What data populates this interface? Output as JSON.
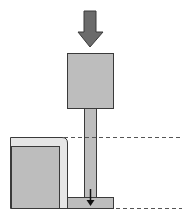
{
  "diagram": {
    "title": "",
    "colors": {
      "background": "#ffffff",
      "force_arrow": "#6b6b6b",
      "block_fill": "#bdbdbd",
      "frame_fill": "#e6e6e6",
      "outline": "#3a3a3a",
      "dash": "#555555"
    },
    "elements": [
      {
        "id": "force-arrow",
        "label": "applied force (downward)"
      },
      {
        "id": "upper-block",
        "label": "punch head"
      },
      {
        "id": "rod",
        "label": "plunger rod"
      },
      {
        "id": "base-plate",
        "label": "base plate"
      },
      {
        "id": "left-frame",
        "label": "outer frame"
      },
      {
        "id": "left-block",
        "label": "inner block"
      },
      {
        "id": "small-arrow",
        "label": "displacement direction"
      },
      {
        "id": "dashed-line-top",
        "label": "upper reference level"
      },
      {
        "id": "dashed-line-bottom",
        "label": "lower reference level"
      }
    ]
  }
}
